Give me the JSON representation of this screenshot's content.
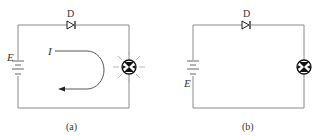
{
  "figure": {
    "panels": [
      {
        "id": "a",
        "caption": "(a)",
        "diode_label": "D",
        "battery_label": "E",
        "current_label": "I",
        "lamp_state": "lit",
        "has_current_arrow": true
      },
      {
        "id": "b",
        "caption": "(b)",
        "diode_label": "D",
        "battery_label": "E",
        "lamp_state": "unlit",
        "has_current_arrow": false
      }
    ],
    "colors": {
      "wire": "#8a8a8a",
      "symbol": "#222222",
      "text": "#333333",
      "rays": "#b0b0b0"
    }
  }
}
